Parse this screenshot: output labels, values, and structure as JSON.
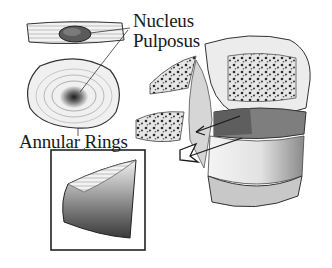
{
  "diagram": {
    "labels": {
      "nucleus_line1": "Nucleus",
      "nucleus_line2": "Pulposus",
      "annular": "Annular Rings"
    },
    "parts": [
      "disc-side-view",
      "disc-top-view",
      "annulus-wedge-inset",
      "vertebra-with-herniation",
      "herniation-arrows"
    ],
    "colors": {
      "ink": "#1a1a1a",
      "dark_gray": "#555555",
      "mid_gray": "#8c8c8c",
      "light_gray": "#d9d9d9",
      "background": "#ffffff"
    }
  }
}
